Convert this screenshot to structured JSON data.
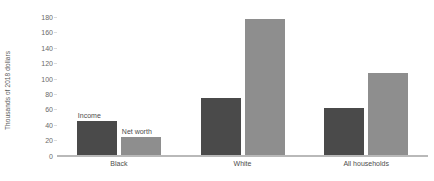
{
  "chart_data": {
    "type": "bar",
    "title": "",
    "subtitle": "",
    "xlabel": "",
    "ylabel": "Thousands of 2018 dollars",
    "ylim": [
      0,
      180
    ],
    "ytick_step": 20,
    "yticks": [
      "0",
      "20",
      "40",
      "60",
      "80",
      "100",
      "120",
      "140",
      "160",
      "180"
    ],
    "grid": false,
    "legend_position": "inline-annotation",
    "categories": [
      "Black",
      "White",
      "All households"
    ],
    "series": [
      {
        "name": "Income",
        "color": "#4a4a4a",
        "values": [
          44,
          74,
          61
        ]
      },
      {
        "name": "Net worth",
        "color": "#8e8e8e",
        "values": [
          23,
          177,
          107
        ]
      }
    ],
    "annotations": [
      {
        "text": "Income",
        "series": "Income",
        "category": "Black"
      },
      {
        "text": "Net worth",
        "series": "Net worth",
        "category": "Black"
      }
    ]
  },
  "colors": {
    "income": "#4a4a4a",
    "net_worth": "#8e8e8e",
    "axis": "#b9b9b9",
    "tick_text": "#6a6a6a",
    "label_text": "#4d4d4d",
    "background": "#ffffff"
  }
}
